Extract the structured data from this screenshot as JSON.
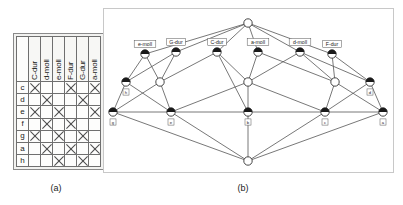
{
  "figure": {
    "caption_a": "(a)",
    "caption_b": "(b)"
  },
  "table": {
    "corner_label": "",
    "column_headers": [
      "C-dur",
      "d-moll",
      "e-moll",
      "F-dur",
      "G-dur",
      "a-moll"
    ],
    "row_headers": [
      "c",
      "d",
      "e",
      "f",
      "g",
      "a",
      "h"
    ],
    "mark_glyph": "X",
    "rows": [
      {
        "label": "c",
        "cells": [
          true,
          false,
          false,
          true,
          false,
          true
        ]
      },
      {
        "label": "d",
        "cells": [
          false,
          true,
          false,
          false,
          true,
          false
        ]
      },
      {
        "label": "e",
        "cells": [
          true,
          false,
          true,
          false,
          false,
          true
        ]
      },
      {
        "label": "f",
        "cells": [
          false,
          true,
          false,
          true,
          false,
          false
        ]
      },
      {
        "label": "g",
        "cells": [
          true,
          false,
          true,
          false,
          true,
          false
        ]
      },
      {
        "label": "a",
        "cells": [
          false,
          true,
          false,
          true,
          false,
          true
        ]
      },
      {
        "label": "h",
        "cells": [
          false,
          false,
          true,
          false,
          true,
          false
        ]
      }
    ]
  },
  "lattice": {
    "top_node": {
      "id": "top",
      "x": 144,
      "y": 14,
      "fill": "empty",
      "label": ""
    },
    "bottom_node": {
      "id": "bottom",
      "x": 144,
      "y": 152,
      "fill": "empty",
      "label": ""
    },
    "attribute_nodes": [
      {
        "id": "e-moll",
        "x": 41,
        "y": 45,
        "label": "e-moll",
        "fill": "half"
      },
      {
        "id": "G-dur",
        "x": 72,
        "y": 43,
        "label": "G-dur",
        "fill": "half"
      },
      {
        "id": "C-dur",
        "x": 113,
        "y": 43,
        "label": "C-dur",
        "fill": "half"
      },
      {
        "id": "a-moll",
        "x": 154,
        "y": 43,
        "label": "a-moll",
        "fill": "half"
      },
      {
        "id": "d-moll",
        "x": 196,
        "y": 43,
        "label": "d-moll",
        "fill": "half"
      },
      {
        "id": "F-dur",
        "x": 228,
        "y": 45,
        "label": "F-dur",
        "fill": "half"
      }
    ],
    "middle_nodes": [
      {
        "id": "m-h",
        "x": 22,
        "y": 73,
        "label": "h",
        "fill": "half"
      },
      {
        "id": "m-left",
        "x": 56,
        "y": 73,
        "label": "",
        "fill": "empty"
      },
      {
        "id": "m-cent",
        "x": 144,
        "y": 73,
        "label": "",
        "fill": "empty"
      },
      {
        "id": "m-right",
        "x": 231,
        "y": 73,
        "label": "",
        "fill": "empty"
      },
      {
        "id": "m-d",
        "x": 266,
        "y": 73,
        "label": "d",
        "fill": "half"
      }
    ],
    "object_nodes": [
      {
        "id": "o-g",
        "x": 9,
        "y": 103,
        "label": "g",
        "fill": "half"
      },
      {
        "id": "o-e",
        "x": 67,
        "y": 103,
        "label": "e",
        "fill": "half"
      },
      {
        "id": "o-b",
        "x": 144,
        "y": 103,
        "label": "b",
        "fill": "half"
      },
      {
        "id": "o-c",
        "x": 221,
        "y": 103,
        "label": "c",
        "fill": "half"
      },
      {
        "id": "o-a",
        "x": 279,
        "y": 103,
        "label": "a",
        "fill": "half"
      }
    ],
    "edges": [
      [
        "top",
        "e-moll"
      ],
      [
        "top",
        "G-dur"
      ],
      [
        "top",
        "C-dur"
      ],
      [
        "top",
        "a-moll"
      ],
      [
        "top",
        "d-moll"
      ],
      [
        "top",
        "F-dur"
      ],
      [
        "e-moll",
        "m-h"
      ],
      [
        "e-moll",
        "m-left"
      ],
      [
        "G-dur",
        "m-h"
      ],
      [
        "G-dur",
        "m-left"
      ],
      [
        "C-dur",
        "m-left"
      ],
      [
        "C-dur",
        "m-cent"
      ],
      [
        "a-moll",
        "m-cent"
      ],
      [
        "d-moll",
        "m-cent"
      ],
      [
        "d-moll",
        "m-right"
      ],
      [
        "F-dur",
        "m-right"
      ],
      [
        "F-dur",
        "m-d"
      ],
      [
        "a-moll",
        "m-right"
      ],
      [
        "C-dur",
        "o-b"
      ],
      [
        "d-moll",
        "m-d"
      ],
      [
        "m-h",
        "o-g"
      ],
      [
        "m-h",
        "o-e"
      ],
      [
        "m-left",
        "o-e"
      ],
      [
        "m-left",
        "o-g"
      ],
      [
        "m-cent",
        "o-b"
      ],
      [
        "m-cent",
        "o-e"
      ],
      [
        "m-cent",
        "o-c"
      ],
      [
        "m-right",
        "o-c"
      ],
      [
        "m-right",
        "o-a"
      ],
      [
        "m-d",
        "o-c"
      ],
      [
        "m-d",
        "o-a"
      ],
      [
        "o-g",
        "bottom"
      ],
      [
        "o-e",
        "bottom"
      ],
      [
        "o-b",
        "bottom"
      ],
      [
        "o-c",
        "bottom"
      ],
      [
        "o-a",
        "bottom"
      ],
      [
        "o-g",
        "o-a"
      ]
    ],
    "node_colors": {
      "stroke": "#333333",
      "fill_dark": "#1a1a1a",
      "fill_empty": "#ffffff"
    },
    "edge_color": "#555555"
  }
}
